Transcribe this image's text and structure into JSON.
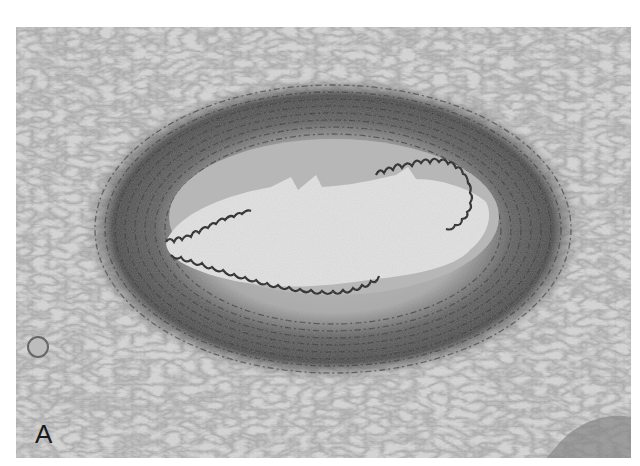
{
  "figure": {
    "panel_label": "A",
    "colors": {
      "background": "#ffffff",
      "tissue": "#d6d6d6",
      "adventitia_fibers": "#7a7a7a",
      "media_dark": "#4a4a4a",
      "intima": "#b8b8b8",
      "lumen": "#e6e6e6",
      "elastic_lamina": "#1e1e1e"
    }
  }
}
